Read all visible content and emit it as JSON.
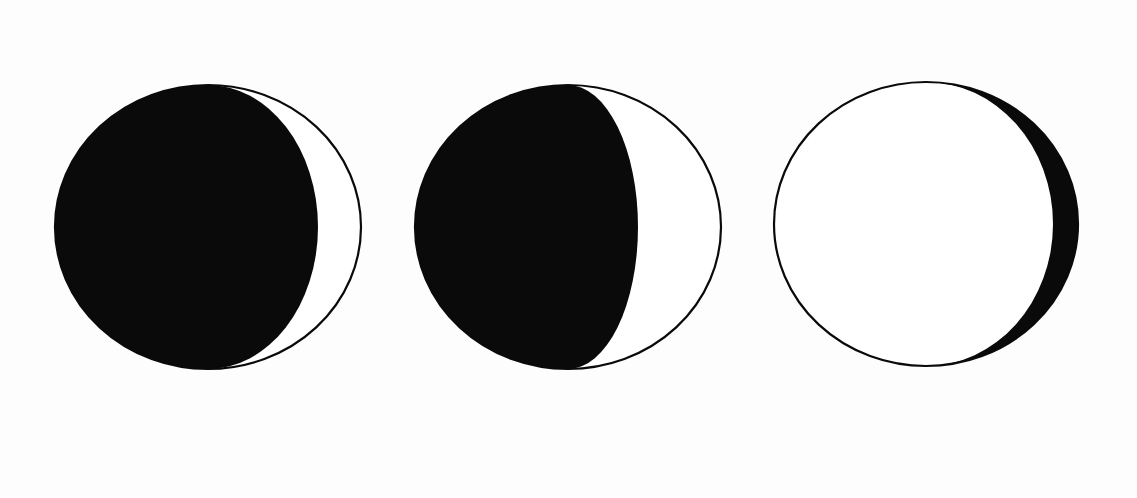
{
  "diagram": {
    "type": "moon-phase-sequence",
    "background_color": "#fdfdfd",
    "ink_color": "#0a0a0a",
    "lit_color": "#ffffff",
    "outline_width": 2.2,
    "phases": [
      {
        "name": "waxing-crescent-thin",
        "cx": 208,
        "cy": 227,
        "rx": 153,
        "ry": 142,
        "shadow_side": "left",
        "terminator_offset": 110,
        "description": "Mostly dark disc with narrow lit crescent on right"
      },
      {
        "name": "waxing-crescent-wide",
        "cx": 568,
        "cy": 227,
        "rx": 153,
        "ry": 142,
        "shadow_side": "left",
        "terminator_offset": 70,
        "description": "Dark disc with wider lit crescent on right"
      },
      {
        "name": "waxing-gibbous-near-full",
        "cx": 926,
        "cy": 224,
        "rx": 152,
        "ry": 142,
        "shadow_side": "right",
        "terminator_offset": 127,
        "description": "Mostly lit disc with narrow dark crescent on right"
      }
    ]
  }
}
